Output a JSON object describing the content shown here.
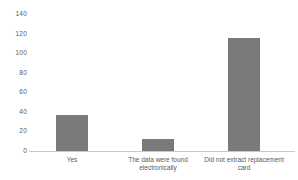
{
  "chart_data": {
    "type": "bar",
    "title": "",
    "xlabel": "",
    "ylabel": "",
    "categories": [
      "Yes",
      "The data were found electronically",
      "Did not extract replacement card"
    ],
    "values": [
      37,
      12,
      115
    ],
    "ylim": [
      0,
      140
    ],
    "yticks": [
      0,
      20,
      40,
      60,
      80,
      100,
      120,
      140
    ],
    "grid": false,
    "legend": false,
    "background_color": "#ffffff",
    "bar_color": "#7a7a7a",
    "axis_line_color": "#c9c9c9",
    "tick_label_color": "#595959"
  }
}
